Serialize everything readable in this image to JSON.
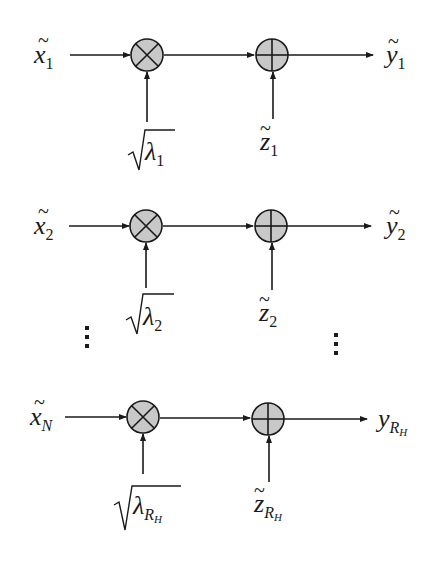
{
  "diagram": {
    "colors": {
      "line": "#1a1a1a",
      "node_fill": "#c8c8c8",
      "background": "#ffffff"
    },
    "rows": [
      {
        "input": {
          "base": "x",
          "tilde": true,
          "sub": "1"
        },
        "gain": {
          "base": "λ",
          "sub": "1",
          "sqrt": true
        },
        "noise": {
          "base": "z",
          "tilde": true,
          "sub": "1"
        },
        "output": {
          "base": "y",
          "tilde": true,
          "sub": "1"
        },
        "multiplier_symbol": "⊗",
        "adder_symbol": "⊕"
      },
      {
        "input": {
          "base": "x",
          "tilde": true,
          "sub": "2"
        },
        "gain": {
          "base": "λ",
          "sub": "2",
          "sqrt": true
        },
        "noise": {
          "base": "z",
          "tilde": true,
          "sub": "2"
        },
        "output": {
          "base": "y",
          "tilde": true,
          "sub": "2"
        },
        "multiplier_symbol": "⊗",
        "adder_symbol": "⊕"
      },
      {
        "input": {
          "base": "x",
          "tilde": true,
          "sub": "N"
        },
        "gain": {
          "base": "λ",
          "sub": "R",
          "subsub": "H",
          "sqrt": true
        },
        "noise": {
          "base": "z",
          "tilde": true,
          "sub": "R",
          "subsub": "H"
        },
        "output": {
          "base": "y",
          "tilde": false,
          "sub": "R",
          "subsub": "H"
        },
        "multiplier_symbol": "⊗",
        "adder_symbol": "⊕"
      }
    ],
    "ellipsis": "⋮"
  }
}
